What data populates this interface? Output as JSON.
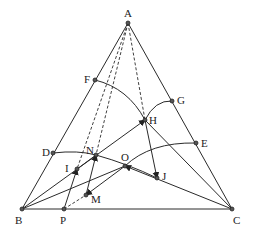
{
  "points": {
    "A": {
      "label": "A",
      "x": 128,
      "y": 23,
      "lx": 124,
      "ly": 17
    },
    "B": {
      "label": "B",
      "x": 22,
      "y": 209,
      "lx": 15,
      "ly": 224
    },
    "C": {
      "label": "C",
      "x": 232,
      "y": 209,
      "lx": 233,
      "ly": 224
    },
    "P": {
      "label": "P",
      "x": 64,
      "y": 209,
      "lx": 60,
      "ly": 224
    },
    "F": {
      "label": "F",
      "x": 95,
      "y": 80,
      "lx": 84,
      "ly": 83
    },
    "G": {
      "label": "G",
      "x": 172,
      "y": 101,
      "lx": 177,
      "ly": 104
    },
    "H": {
      "label": "H",
      "x": 145,
      "y": 120,
      "lx": 149,
      "ly": 124
    },
    "D": {
      "label": "D",
      "x": 53,
      "y": 153,
      "lx": 42,
      "ly": 156
    },
    "E": {
      "label": "E",
      "x": 196,
      "y": 143,
      "lx": 201,
      "ly": 147
    },
    "N": {
      "label": "N",
      "x": 96,
      "y": 155,
      "lx": 86,
      "ly": 154
    },
    "I": {
      "label": "I",
      "x": 77,
      "y": 169,
      "lx": 65,
      "ly": 172
    },
    "O": {
      "label": "O",
      "x": 125,
      "y": 166,
      "lx": 121,
      "ly": 161
    },
    "J": {
      "label": "J",
      "x": 157,
      "y": 178,
      "lx": 162,
      "ly": 180
    },
    "M": {
      "label": "M",
      "x": 86,
      "y": 195,
      "lx": 91,
      "ly": 203
    }
  },
  "segments": [
    "A-B",
    "A-C",
    "B-C",
    "B-H",
    "B-O",
    "H-C",
    "O-C",
    "P-N",
    "H-J",
    "N-M",
    "O-M"
  ],
  "dashed_segments": [
    "A-I",
    "A-N",
    "A-H",
    "P-M"
  ],
  "arcs": [
    "F-H",
    "H-G",
    "D-N-J",
    "O-E"
  ],
  "arrows": [
    "P->I",
    "B->H",
    "M->N",
    "H->J",
    "C->O",
    "O->M"
  ]
}
